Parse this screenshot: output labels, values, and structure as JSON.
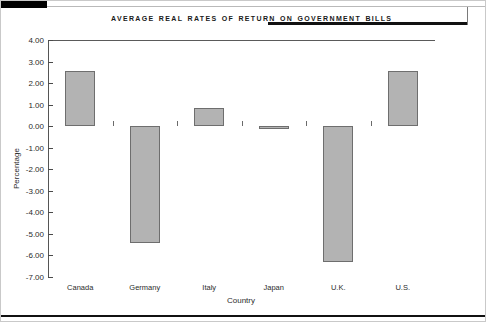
{
  "figure": {
    "title": "Average Real Rates of Return on Government Bills"
  },
  "chart_data": {
    "type": "bar",
    "title": "Average Real Rates of Return on Government Bills",
    "categories": [
      "Canada",
      "Germany",
      "Italy",
      "Japan",
      "U.K.",
      "U.S."
    ],
    "values": [
      2.55,
      -5.4,
      0.85,
      -0.15,
      -6.3,
      2.55
    ],
    "xlabel": "Country",
    "ylabel": "Percentage",
    "ylim": [
      -7.0,
      4.0
    ],
    "ytick_step": 1.0,
    "yticks": [
      "4.00",
      "3.00",
      "2.00",
      "1.00",
      "0.00",
      "-1.00",
      "-2.00",
      "-3.00",
      "-4.00",
      "-5.00",
      "-6.00",
      "-7.00"
    ],
    "ytick_values": [
      4,
      3,
      2,
      1,
      0,
      -1,
      -2,
      -3,
      -4,
      -5,
      -6,
      -7
    ],
    "grid": false,
    "legend": null,
    "bar_color": "#b3b3b3",
    "bar_edge_color": "#6e6e6e"
  }
}
